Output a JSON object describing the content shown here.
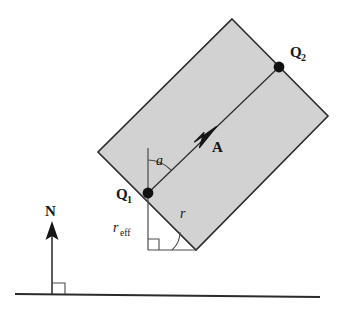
{
  "figure": {
    "background_color": "#ffffff",
    "stroke_color": "#2b2b2b",
    "fill_color": "#d2d2d2",
    "labels": {
      "point_1": "Q",
      "point_1_sub": "1",
      "point_2": "Q",
      "point_2_sub": "2",
      "vector_a": "A",
      "vector_n": "N",
      "angle_a": "a",
      "angle_r": "r",
      "r_eff": "r",
      "r_eff_sub": "eff"
    },
    "geometry": {
      "rect_top": "232,19",
      "rect_left": "98,152",
      "rect_bottom": "196,250",
      "rect_right": "328,116",
      "point_1_xy": "148,193",
      "point_2_xy": "279,67",
      "ground_y": "295",
      "ground_x_start": "15",
      "ground_x_end": "320",
      "n_arrow_x": "52",
      "n_arrow_top": "222"
    }
  }
}
